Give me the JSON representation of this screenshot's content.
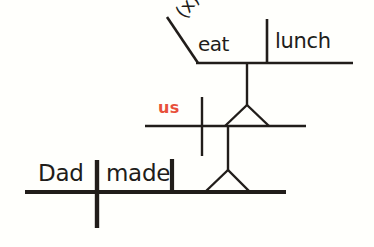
{
  "diagram": {
    "background_color": "#fffffc",
    "ink_color": "#211d1a",
    "accent_color": "#e8503a",
    "sentence": "Dad made us eat lunch",
    "clauses": {
      "main": {
        "subject": "Dad",
        "verb": "made",
        "baseline_weight": "thick"
      },
      "middle": {
        "object_complement": "us",
        "baseline_weight": "thin"
      },
      "top": {
        "implied_subject": "(x)",
        "verb": "eat",
        "direct_object": "lunch",
        "baseline_weight": "thin"
      }
    }
  },
  "labels": {
    "implied_subject": "(x)",
    "verb_eat": "eat",
    "object_lunch": "lunch",
    "pronoun_us": "us",
    "subject_dad": "Dad",
    "verb_made": "made"
  }
}
